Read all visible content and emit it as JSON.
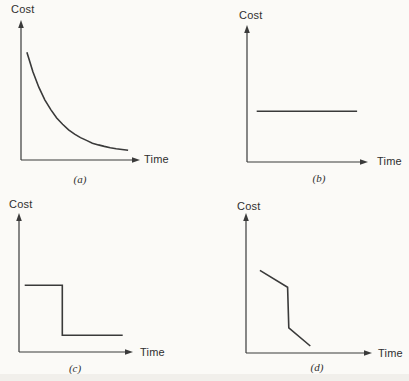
{
  "page": {
    "background_color": "#fbfaf7",
    "ink_color": "#3a3a3a",
    "text_color": "#2f2f2f"
  },
  "chart_data": [
    {
      "id": "a",
      "type": "line",
      "title": "",
      "xlabel": "Time",
      "ylabel": "Cost",
      "caption": "(a)",
      "trend": "exponential decay: cost falls steeply at first then levels off asymptotically over time",
      "axes_unlabeled": true,
      "grid": false,
      "legend": false,
      "x_range": [
        0,
        1
      ],
      "y_range": [
        0,
        1
      ],
      "points": [
        [
          0.05,
          0.77
        ],
        [
          0.1,
          0.63
        ],
        [
          0.15,
          0.52
        ],
        [
          0.2,
          0.43
        ],
        [
          0.25,
          0.36
        ],
        [
          0.3,
          0.3
        ],
        [
          0.35,
          0.255
        ],
        [
          0.4,
          0.215
        ],
        [
          0.45,
          0.185
        ],
        [
          0.5,
          0.16
        ],
        [
          0.55,
          0.14
        ],
        [
          0.6,
          0.12
        ],
        [
          0.65,
          0.108
        ],
        [
          0.7,
          0.097
        ],
        [
          0.75,
          0.088
        ],
        [
          0.8,
          0.081
        ],
        [
          0.85,
          0.075
        ],
        [
          0.9,
          0.07
        ]
      ]
    },
    {
      "id": "b",
      "type": "line",
      "title": "",
      "xlabel": "Time",
      "ylabel": "Cost",
      "caption": "(b)",
      "trend": "constant: flat horizontal cost line below mid-height across time",
      "axes_unlabeled": true,
      "grid": false,
      "legend": false,
      "x_range": [
        0,
        1
      ],
      "y_range": [
        0,
        1
      ],
      "points": [
        [
          0.08,
          0.37
        ],
        [
          0.91,
          0.37
        ]
      ]
    },
    {
      "id": "c",
      "type": "line",
      "title": "",
      "xlabel": "Time",
      "ylabel": "Cost",
      "caption": "(c)",
      "trend": "single step decrease: cost constant at high level, vertical drop about a third of the way along, then constant at low level",
      "axes_unlabeled": true,
      "grid": false,
      "legend": false,
      "x_range": [
        0,
        1
      ],
      "y_range": [
        0,
        1
      ],
      "points": [
        [
          0.05,
          0.48
        ],
        [
          0.38,
          0.48
        ],
        [
          0.38,
          0.12
        ],
        [
          0.91,
          0.12
        ]
      ]
    },
    {
      "id": "d",
      "type": "line",
      "title": "",
      "xlabel": "Time",
      "ylabel": "Cost",
      "caption": "(d)",
      "trend": "gradual decline, then a steep near-vertical drop, then continued gradual decline toward the axis",
      "axes_unlabeled": true,
      "grid": false,
      "legend": false,
      "x_range": [
        0,
        1
      ],
      "y_range": [
        0,
        1
      ],
      "points": [
        [
          0.11,
          0.59
        ],
        [
          0.33,
          0.47
        ],
        [
          0.34,
          0.18
        ],
        [
          0.51,
          0.05
        ]
      ]
    }
  ]
}
